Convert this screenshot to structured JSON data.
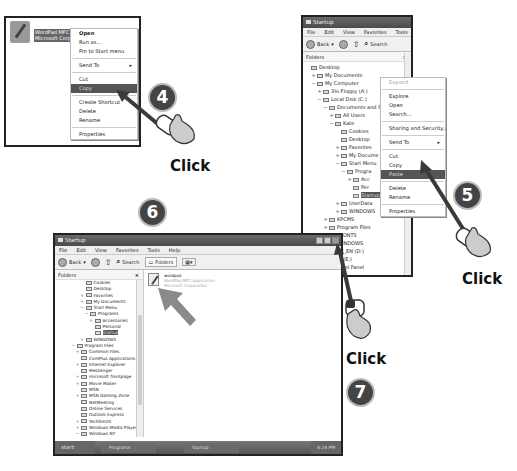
{
  "steps": {
    "step4": {
      "badge": "4",
      "click_label": "Click",
      "file": {
        "lines": [
          "wordpad",
          "WordPad MFC",
          "Microsoft Corp"
        ],
        "icon": "wordpad-file-icon"
      },
      "context_menu": [
        {
          "label": "Open",
          "bold": true
        },
        {
          "label": "Run as..."
        },
        {
          "label": "Pin to Start menu"
        },
        {
          "sep": true
        },
        {
          "label": "Send To",
          "submenu": true
        },
        {
          "sep": true
        },
        {
          "label": "Cut"
        },
        {
          "label": "Copy",
          "highlighted": true
        },
        {
          "sep": true
        },
        {
          "label": "Create Shortcut"
        },
        {
          "label": "Delete"
        },
        {
          "label": "Rename"
        },
        {
          "sep": true
        },
        {
          "label": "Properties"
        }
      ]
    },
    "step5": {
      "badge": "5",
      "click_label": "Click",
      "window": {
        "title": "Startup",
        "menu": [
          "File",
          "Edit",
          "View",
          "Favorites",
          "Tools",
          "Help"
        ],
        "toolbar": {
          "back": "Back",
          "search": "Search"
        },
        "folders_header": "Folders",
        "close_glyph": "×",
        "tree": [
          {
            "label": "Desktop",
            "indent": 0,
            "exp": ""
          },
          {
            "label": "My Documents",
            "indent": 1,
            "exp": "+"
          },
          {
            "label": "My Computer",
            "indent": 1,
            "exp": "−"
          },
          {
            "label": "3½ Floppy (A:)",
            "indent": 2,
            "exp": "+"
          },
          {
            "label": "Local Disk (C:)",
            "indent": 2,
            "exp": "−"
          },
          {
            "label": "Documents and Set",
            "indent": 3,
            "exp": "−"
          },
          {
            "label": "All Users",
            "indent": 4,
            "exp": "+"
          },
          {
            "label": "Kate",
            "indent": 4,
            "exp": "−"
          },
          {
            "label": "Cookies",
            "indent": 5,
            "exp": ""
          },
          {
            "label": "Desktop",
            "indent": 5,
            "exp": ""
          },
          {
            "label": "Favorites",
            "indent": 5,
            "exp": "+"
          },
          {
            "label": "My Docume",
            "indent": 5,
            "exp": "+"
          },
          {
            "label": "Start Menu",
            "indent": 5,
            "exp": "−"
          },
          {
            "label": "Progra",
            "indent": 6,
            "exp": "−"
          },
          {
            "label": "Acc",
            "indent": 7,
            "exp": "+"
          },
          {
            "label": "Per",
            "indent": 7,
            "exp": ""
          },
          {
            "label": "Startup",
            "indent": 7,
            "exp": "",
            "selected": true
          },
          {
            "label": "UserData",
            "indent": 5,
            "exp": "+"
          },
          {
            "label": "WINDOWS",
            "indent": 5,
            "exp": "+"
          },
          {
            "label": "KPCMS",
            "indent": 3,
            "exp": "+"
          },
          {
            "label": "Program Files",
            "indent": 3,
            "exp": "+"
          },
          {
            "label": "PFONTS",
            "indent": 3,
            "exp": ""
          },
          {
            "label": "WINDOWS",
            "indent": 3,
            "exp": ""
          },
          {
            "label": "SETE_EN (D:)",
            "indent": 2,
            "exp": ""
          },
          {
            "label": "Disk (E:)",
            "indent": 2,
            "exp": ""
          },
          {
            "label": "Control Panel",
            "indent": 2,
            "exp": ""
          },
          {
            "label": "Digital Camera",
            "indent": 2,
            "exp": ""
          }
        ]
      },
      "context_menu": [
        {
          "label": "Expand",
          "disabled": true
        },
        {
          "sep": true
        },
        {
          "label": "Explore"
        },
        {
          "label": "Open"
        },
        {
          "label": "Search..."
        },
        {
          "sep": true
        },
        {
          "label": "Sharing and Security..."
        },
        {
          "sep": true
        },
        {
          "label": "Send To",
          "submenu": true
        },
        {
          "sep": true
        },
        {
          "label": "Cut"
        },
        {
          "label": "Copy"
        },
        {
          "label": "Paste",
          "highlighted": true
        },
        {
          "sep": true
        },
        {
          "label": "Delete"
        },
        {
          "label": "Rename"
        },
        {
          "sep": true
        },
        {
          "label": "Properties"
        }
      ]
    },
    "step6": {
      "badge": "6",
      "window": {
        "title": "Startup",
        "menu": [
          "File",
          "Edit",
          "View",
          "Favorites",
          "Tools",
          "Help"
        ],
        "toolbar": {
          "back": "Back",
          "search": "Search",
          "folders": "Folders"
        },
        "folders_header": "Folders",
        "close_glyph": "×",
        "tree": [
          {
            "label": "Cookies",
            "indent": 5,
            "exp": ""
          },
          {
            "label": "Desktop",
            "indent": 5,
            "exp": ""
          },
          {
            "label": "Favorites",
            "indent": 5,
            "exp": "+"
          },
          {
            "label": "My Documents",
            "indent": 5,
            "exp": "+"
          },
          {
            "label": "Start Menu",
            "indent": 5,
            "exp": "−"
          },
          {
            "label": "Programs",
            "indent": 6,
            "exp": "−"
          },
          {
            "label": "Accessories",
            "indent": 7,
            "exp": "+"
          },
          {
            "label": "Personal",
            "indent": 7,
            "exp": ""
          },
          {
            "label": "Startup",
            "indent": 7,
            "exp": "",
            "selected": true
          },
          {
            "label": "WINDOWS",
            "indent": 5,
            "exp": "+"
          },
          {
            "label": "Program Files",
            "indent": 3,
            "exp": "−"
          },
          {
            "label": "Common Files",
            "indent": 4,
            "exp": "+"
          },
          {
            "label": "ComPlus Applications",
            "indent": 4,
            "exp": ""
          },
          {
            "label": "Internet Explorer",
            "indent": 4,
            "exp": "+"
          },
          {
            "label": "Messenger",
            "indent": 4,
            "exp": ""
          },
          {
            "label": "microsoft frontpage",
            "indent": 4,
            "exp": "+"
          },
          {
            "label": "Movie Maker",
            "indent": 4,
            "exp": "+"
          },
          {
            "label": "MSN",
            "indent": 4,
            "exp": ""
          },
          {
            "label": "MSN Gaming Zone",
            "indent": 4,
            "exp": "+"
          },
          {
            "label": "NetMeeting",
            "indent": 4,
            "exp": ""
          },
          {
            "label": "Online Services",
            "indent": 4,
            "exp": ""
          },
          {
            "label": "Outlook Express",
            "indent": 4,
            "exp": ""
          },
          {
            "label": "TechSmith",
            "indent": 4,
            "exp": "+"
          },
          {
            "label": "Windows Media Player",
            "indent": 4,
            "exp": "+"
          },
          {
            "label": "Windows NT",
            "indent": 4,
            "exp": "−"
          },
          {
            "label": "Accessories",
            "indent": 5,
            "exp": ""
          },
          {
            "label": "Pinball",
            "indent": 5,
            "exp": ""
          }
        ],
        "file": {
          "name": "wordpad",
          "desc": "WordPad MFC Application",
          "company": "Microsoft Corporation"
        },
        "taskbar": {
          "start": "start",
          "tasks": [
            "Programs",
            "Startup"
          ],
          "clock": "4:24 PM"
        }
      }
    },
    "step7": {
      "badge": "7",
      "click_label": "Click",
      "target": "close-window-button"
    }
  },
  "colors": {
    "highlight": "#555555",
    "badge_bg": "#444444",
    "arrow": "#3a3a3a",
    "pointer_arrow": "#8a8a8a"
  }
}
